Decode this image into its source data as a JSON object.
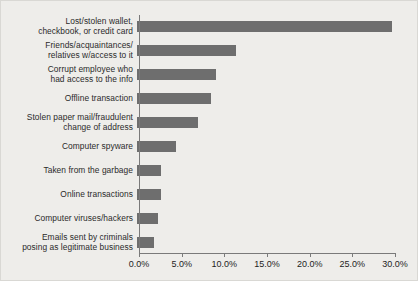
{
  "chart_data": {
    "type": "bar",
    "orientation": "horizontal",
    "title": "",
    "xlabel": "",
    "ylabel": "",
    "xlim": [
      0,
      30
    ],
    "xticks": [
      "0.0%",
      "5.0%",
      "10.0%",
      "15.0%",
      "20.0%",
      "25.0%",
      "30.0%"
    ],
    "xtick_values": [
      0,
      5,
      10,
      15,
      20,
      25,
      30
    ],
    "grid": false,
    "legend": "none",
    "bar_color": "#6e6e6e",
    "background_color": "#eeedea",
    "axis_color": "#7a7a7a",
    "categories": [
      "Lost/stolen wallet,\ncheckbook, or credit card",
      "Friends/acquaintances/\nrelatives w/access to it",
      "Corrupt employee who\nhad access to the info",
      "Offline transaction",
      "Stolen paper mail/fraudulent\nchange of address",
      "Computer spyware",
      "Taken from the garbage",
      "Online transactions",
      "Computer viruses/hackers",
      "Emails sent by criminals\nposing as legitimate business"
    ],
    "values": [
      29.9,
      11.6,
      9.3,
      8.7,
      7.2,
      4.6,
      2.8,
      2.8,
      2.5,
      2.0
    ]
  }
}
